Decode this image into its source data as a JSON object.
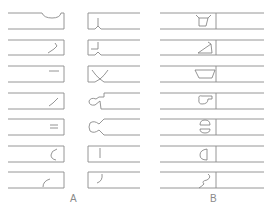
{
  "figure": {
    "groups": [
      {
        "id": "A",
        "label": "A",
        "columns": [
          {
            "side": "left",
            "profiles": [
              "shallow-notch-top",
              "diagonal-hook",
              "horizontal-slot",
              "diagonal-slot",
              "double-slot",
              "c-curve",
              "arc-curve"
            ]
          },
          {
            "side": "right",
            "profiles": [
              "v-point",
              "step-v-point",
              "wide-v",
              "hook-tenon",
              "dovetail-round",
              "vertical-line",
              "j-curve"
            ]
          }
        ]
      },
      {
        "id": "B",
        "label": "B",
        "profiles": [
          "splayed-box",
          "triangle-wedge",
          "trapezoid",
          "rounded-hook",
          "split-circle",
          "half-round",
          "s-curve"
        ]
      }
    ]
  }
}
